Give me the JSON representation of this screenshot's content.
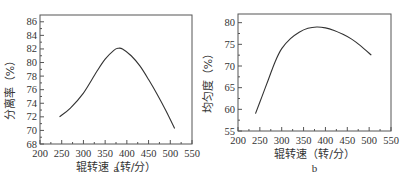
{
  "chart_data": [
    {
      "type": "line",
      "panel_label": "a",
      "title": "",
      "xlabel": "辊转速（转/分）",
      "ylabel": "分离率（%）",
      "xlim": [
        200,
        550
      ],
      "ylim": [
        68,
        87
      ],
      "xticks": [
        200,
        250,
        300,
        350,
        400,
        450,
        500,
        550
      ],
      "yticks": [
        68,
        70,
        72,
        74,
        76,
        78,
        80,
        82,
        84,
        86
      ],
      "grid": false,
      "legend": null,
      "series": [
        {
          "name": "分离率",
          "x": [
            245,
            270,
            300,
            330,
            350,
            370,
            380,
            390,
            410,
            430,
            450,
            470,
            490,
            510
          ],
          "y": [
            72.0,
            73.3,
            75.5,
            78.6,
            80.5,
            81.8,
            82.1,
            82.0,
            81.0,
            79.5,
            77.5,
            75.3,
            72.9,
            70.3
          ]
        }
      ]
    },
    {
      "type": "line",
      "panel_label": "b",
      "title": "",
      "xlabel": "辊转速（转/分）",
      "ylabel": "均匀度（%）",
      "xlim": [
        200,
        550
      ],
      "ylim": [
        55,
        82
      ],
      "xticks": [
        200,
        250,
        300,
        350,
        400,
        450,
        500,
        550
      ],
      "yticks": [
        55,
        60,
        65,
        70,
        75,
        80
      ],
      "grid": false,
      "legend": null,
      "series": [
        {
          "name": "均匀度",
          "x": [
            240,
            255,
            270,
            285,
            300,
            320,
            340,
            360,
            380,
            400,
            420,
            440,
            460,
            480,
            505
          ],
          "y": [
            59.0,
            63.0,
            67.0,
            71.0,
            74.0,
            76.3,
            77.8,
            78.7,
            79.0,
            78.8,
            78.2,
            77.3,
            76.2,
            74.7,
            72.5
          ]
        }
      ]
    }
  ]
}
